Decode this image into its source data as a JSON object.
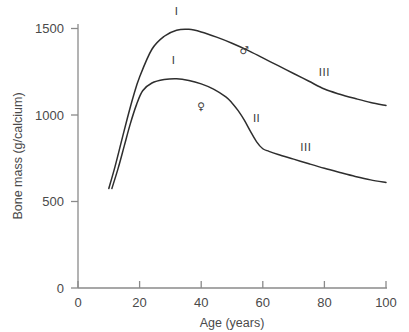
{
  "chart_data": {
    "type": "line",
    "title": "",
    "xlabel": "Age (years)",
    "ylabel": "Bone mass (g/calcium)",
    "xlim": [
      0,
      100
    ],
    "ylim": [
      0,
      1500
    ],
    "xticks": [
      0,
      20,
      40,
      60,
      80,
      100
    ],
    "yticks": [
      0,
      500,
      1000,
      1500
    ],
    "grid": false,
    "legend_position": "inline-annotations",
    "series": [
      {
        "name": "male",
        "symbol": "♂",
        "symbol_label_position": {
          "x": 54,
          "y": 1355
        },
        "x": [
          10,
          12,
          14,
          16,
          18,
          20,
          24,
          28,
          32,
          36,
          40,
          45,
          50,
          55,
          60,
          65,
          70,
          75,
          80,
          85,
          90,
          95,
          100
        ],
        "y": [
          575,
          700,
          840,
          980,
          1110,
          1220,
          1380,
          1455,
          1490,
          1495,
          1480,
          1450,
          1415,
          1375,
          1330,
          1285,
          1240,
          1195,
          1150,
          1120,
          1095,
          1072,
          1055
        ],
        "phase_labels": [
          {
            "text": "I",
            "x": 32,
            "y": 1580
          },
          {
            "text": "III",
            "x": 80,
            "y": 1225
          }
        ]
      },
      {
        "name": "female",
        "symbol": "♀",
        "symbol_label_position": {
          "x": 40,
          "y": 1030
        },
        "x": [
          11,
          13,
          15,
          17,
          19,
          21,
          24,
          28,
          32,
          36,
          40,
          44,
          48,
          50,
          52,
          54,
          56,
          58,
          60,
          62,
          65,
          70,
          75,
          80,
          85,
          90,
          95,
          100
        ],
        "y": [
          575,
          690,
          820,
          950,
          1060,
          1140,
          1185,
          1205,
          1210,
          1200,
          1180,
          1150,
          1105,
          1070,
          1025,
          970,
          905,
          845,
          805,
          790,
          772,
          745,
          718,
          692,
          668,
          645,
          625,
          610
        ],
        "phase_labels": [
          {
            "text": "I",
            "x": 31,
            "y": 1295
          },
          {
            "text": "II",
            "x": 58,
            "y": 960
          },
          {
            "text": "III",
            "x": 74,
            "y": 790
          }
        ]
      }
    ]
  },
  "axes": {
    "y_tick_labels": [
      "1500",
      "1000",
      "500",
      "0"
    ],
    "x_tick_labels": [
      "0",
      "20",
      "40",
      "60",
      "80",
      "100"
    ],
    "y_axis_title": "Bone mass (g/calcium)",
    "x_axis_title": "Age (years)"
  },
  "colors": {
    "curve": "#2e2e2e",
    "axis": "#8a8a8a",
    "text": "#4a4a4a",
    "background": "#ffffff"
  }
}
